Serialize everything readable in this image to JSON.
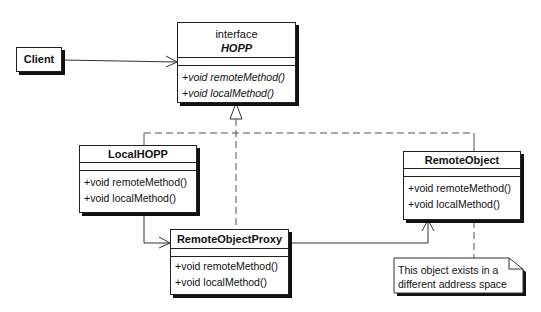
{
  "diagram": {
    "type": "UML class diagram",
    "classes": {
      "client": {
        "name": "Client",
        "operations": []
      },
      "hopp": {
        "stereotype": "interface",
        "name": "HOPP",
        "operations": [
          "+void remoteMethod()",
          "+void localMethod()"
        ]
      },
      "local_hopp": {
        "name": "LocalHOPP",
        "operations": [
          "+void remoteMethod()",
          "+void localMethod()"
        ]
      },
      "remote_object_proxy": {
        "name": "RemoteObjectProxy",
        "operations": [
          "+void remoteMethod()",
          "+void localMethod()"
        ]
      },
      "remote_object": {
        "name": "RemoteObject",
        "operations": [
          "+void remoteMethod()",
          "+void localMethod()"
        ]
      }
    },
    "note": {
      "lines": [
        "This object exists in a",
        "different address space"
      ]
    },
    "relations": [
      {
        "from": "Client",
        "to": "HOPP",
        "kind": "association"
      },
      {
        "from": "LocalHOPP",
        "to": "HOPP",
        "kind": "realization"
      },
      {
        "from": "RemoteObjectProxy",
        "to": "HOPP",
        "kind": "realization"
      },
      {
        "from": "RemoteObject",
        "to": "HOPP",
        "kind": "realization"
      },
      {
        "from": "LocalHOPP",
        "to": "RemoteObjectProxy",
        "kind": "association"
      },
      {
        "from": "RemoteObjectProxy",
        "to": "RemoteObject",
        "kind": "association"
      },
      {
        "from": "note",
        "to": "RemoteObject",
        "kind": "anchor"
      }
    ]
  }
}
